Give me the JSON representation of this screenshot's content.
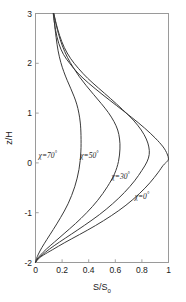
{
  "chart_data": {
    "type": "line",
    "title": "",
    "xlabel": "S/S₀",
    "ylabel": "z/H",
    "xlabel_main": "S/S",
    "xlabel_sub": "0",
    "xlim": [
      0,
      1
    ],
    "ylim": [
      -2,
      3
    ],
    "grid": false,
    "legend_position": "inline-annotations",
    "xticks": [
      "0",
      "0.2",
      "0.4",
      "0.6",
      "0.8",
      "1"
    ],
    "xtick_values": [
      0,
      0.2,
      0.4,
      0.6,
      0.8,
      1
    ],
    "yticks": [
      "3",
      "2",
      "1",
      "0",
      "-1",
      "-2"
    ],
    "ytick_values": [
      3,
      2,
      1,
      0,
      -1,
      -2
    ],
    "line_color": "#3a3a3a",
    "frame_color": "#9a9a9a",
    "background_color": "#ffffff",
    "series": [
      {
        "name": "chi-0",
        "label": "χ=0°",
        "label_x": 0.8,
        "label_y": -0.72,
        "peak_value": 1.0,
        "peak_z": 0.05,
        "x": [
          0.0,
          0.02,
          0.06,
          0.13,
          0.22,
          0.33,
          0.45,
          0.57,
          0.68,
          0.78,
          0.86,
          0.92,
          0.96,
          0.99,
          1.0,
          0.99,
          0.96,
          0.9,
          0.82,
          0.72,
          0.61,
          0.5,
          0.4,
          0.32,
          0.26,
          0.21,
          0.175,
          0.15,
          0.133
        ],
        "y": [
          -2.0,
          -1.93,
          -1.85,
          -1.74,
          -1.6,
          -1.44,
          -1.26,
          -1.06,
          -0.85,
          -0.62,
          -0.4,
          -0.2,
          -0.05,
          0.03,
          0.08,
          0.18,
          0.32,
          0.5,
          0.7,
          0.92,
          1.15,
          1.38,
          1.6,
          1.8,
          1.99,
          2.18,
          2.4,
          2.68,
          3.0
        ]
      },
      {
        "name": "chi-30",
        "label": "χ=30°",
        "label_x": 0.64,
        "label_y": -0.32,
        "peak_value": 0.855,
        "peak_z": 0.18,
        "x": [
          0.0,
          0.016,
          0.05,
          0.105,
          0.18,
          0.27,
          0.37,
          0.48,
          0.58,
          0.67,
          0.745,
          0.8,
          0.838,
          0.855,
          0.852,
          0.833,
          0.795,
          0.735,
          0.655,
          0.565,
          0.475,
          0.392,
          0.322,
          0.263,
          0.216,
          0.181,
          0.155,
          0.138
        ],
        "y": [
          -2.0,
          -1.93,
          -1.85,
          -1.73,
          -1.59,
          -1.43,
          -1.25,
          -1.04,
          -0.82,
          -0.59,
          -0.36,
          -0.15,
          0.02,
          0.17,
          0.32,
          0.48,
          0.66,
          0.86,
          1.07,
          1.29,
          1.5,
          1.7,
          1.9,
          2.1,
          2.32,
          2.56,
          2.8,
          3.0
        ]
      },
      {
        "name": "chi-50",
        "label": "χ=50°",
        "label_x": 0.405,
        "label_y": 0.1,
        "peak_value": 0.635,
        "peak_z": 0.4,
        "x": [
          0.0,
          0.012,
          0.038,
          0.082,
          0.142,
          0.215,
          0.3,
          0.385,
          0.468,
          0.54,
          0.594,
          0.624,
          0.635,
          0.632,
          0.618,
          0.59,
          0.548,
          0.495,
          0.438,
          0.382,
          0.33,
          0.283,
          0.24,
          0.202,
          0.172,
          0.15,
          0.137
        ],
        "y": [
          -2.0,
          -1.93,
          -1.85,
          -1.73,
          -1.59,
          -1.42,
          -1.22,
          -1.0,
          -0.75,
          -0.48,
          -0.22,
          0.03,
          0.28,
          0.48,
          0.66,
          0.83,
          1.01,
          1.19,
          1.37,
          1.55,
          1.73,
          1.92,
          2.12,
          2.35,
          2.6,
          2.84,
          3.0
        ]
      },
      {
        "name": "chi-70",
        "label": "χ=70°",
        "label_x": 0.092,
        "label_y": 0.1,
        "peak_value": 0.342,
        "peak_z": 0.62,
        "x": [
          0.0,
          0.008,
          0.022,
          0.048,
          0.085,
          0.133,
          0.188,
          0.245,
          0.295,
          0.327,
          0.341,
          0.342,
          0.337,
          0.326,
          0.31,
          0.289,
          0.264,
          0.238,
          0.213,
          0.19,
          0.17,
          0.155,
          0.143,
          0.135
        ],
        "y": [
          -2.0,
          -1.92,
          -1.83,
          -1.7,
          -1.54,
          -1.34,
          -1.1,
          -0.82,
          -0.48,
          -0.13,
          0.22,
          0.55,
          0.8,
          1.0,
          1.18,
          1.34,
          1.5,
          1.66,
          1.83,
          2.02,
          2.25,
          2.52,
          2.8,
          3.0
        ]
      }
    ]
  }
}
